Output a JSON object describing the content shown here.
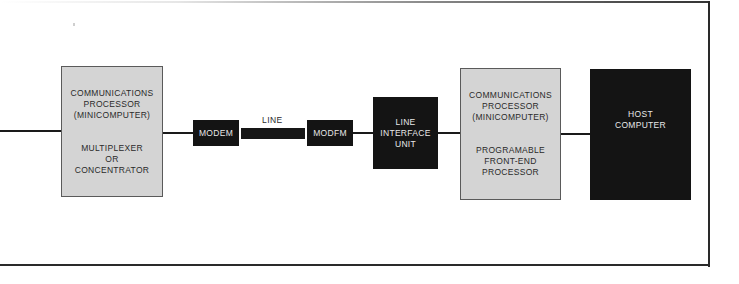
{
  "diagram": {
    "left_processor": {
      "title": "COMMUNICATIONS\nPROCESSOR\n(MINICOMPUTER)",
      "role": "MULTIPLEXER\nOR\nCONCENTRATOR"
    },
    "modem_left": {
      "label": "MODEM"
    },
    "line": {
      "label": "LINE"
    },
    "modem_right": {
      "label": "MODFM"
    },
    "line_interface_unit": {
      "label": "LINE\nINTERFACE\nUNIT"
    },
    "right_processor": {
      "title": "COMMUNICATIONS\nPROCESSOR\n(MINICOMPUTER)",
      "role": "PROGRAMABLE\nFRONT-END\nPROCESSOR"
    },
    "host": {
      "label": "HOST\nCOMPUTER"
    },
    "colors": {
      "processor_fill": "#d4d4d4",
      "dark_fill": "#141414",
      "line_color": "#1a1a1a"
    }
  }
}
